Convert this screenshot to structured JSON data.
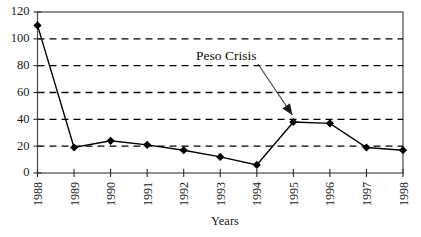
{
  "chart_data": {
    "type": "line",
    "title": "",
    "xlabel": "Years",
    "ylabel": "",
    "categories": [
      "1988",
      "1989",
      "1990",
      "1991",
      "1992",
      "1993",
      "1994",
      "1995",
      "1996",
      "1997",
      "1998"
    ],
    "values": [
      110,
      19,
      24,
      21,
      17,
      12,
      6,
      38,
      37,
      19,
      17
    ],
    "ylim": [
      0,
      120
    ],
    "yticks": [
      0,
      20,
      40,
      60,
      80,
      100,
      120
    ],
    "ytick_labels": [
      "0",
      "20",
      "40",
      "60",
      "80",
      "100",
      "120"
    ],
    "grid": "horizontal-dashed",
    "legend": "none",
    "marker": "diamond",
    "line_color": "#000000",
    "marker_color": "#000000",
    "grid_color": "#000000",
    "frame_color": "#4a4a4a",
    "annotations": [
      {
        "text": "Peso Crisis",
        "points_to_category": "1995",
        "points_to_value": 38
      }
    ]
  },
  "axis": {
    "x_title": "Years"
  }
}
